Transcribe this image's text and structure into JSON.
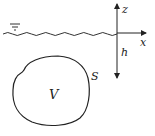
{
  "diagram": {
    "labels": {
      "z_axis": "z",
      "x_axis": "x",
      "depth": "h",
      "volume": "V",
      "surface": "S"
    },
    "symbols": {
      "free_surface": "water-level-symbol"
    },
    "colors": {
      "stroke": "#222222",
      "background": "#ffffff"
    }
  }
}
